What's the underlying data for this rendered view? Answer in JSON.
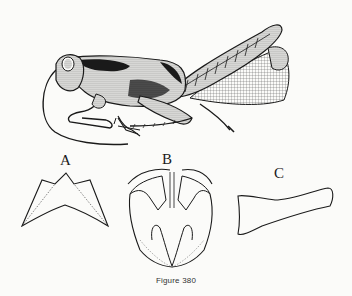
{
  "figure": {
    "caption": "Figure 380",
    "panels": [
      {
        "label": "A",
        "description": "subgenital plate outline"
      },
      {
        "label": "B",
        "description": "genitalia ventral view"
      },
      {
        "label": "C",
        "description": "cercus outline"
      }
    ]
  },
  "colors": {
    "background": "#fbfbf9",
    "ink": "#1a1a1a"
  }
}
